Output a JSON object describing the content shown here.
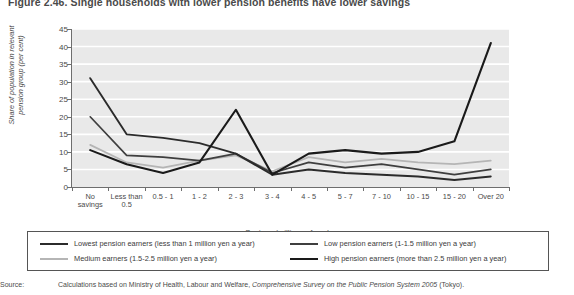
{
  "figure": {
    "title": "Figure 2.46. Single households with lower pension benefits have lower savings"
  },
  "source": {
    "label": "Source:",
    "prefix": "Calculations based on Ministry of Health, Labour and Welfare, ",
    "italic": "Comprehensive Survey on the Public Pension System 2005",
    "suffix": " (Tokyo)."
  },
  "axes": {
    "ylabel": "Share of population in relevant pension group (per cent)",
    "xlabel": "Savings (millions of yen)",
    "yticks": [
      "0",
      "5",
      "10",
      "15",
      "20",
      "25",
      "30",
      "35",
      "40",
      "45"
    ]
  },
  "legend": {
    "items": [
      {
        "label": "Lowest pension earners (less than 1 million yen a year)",
        "color": "#2b2b2b",
        "width": 1.9
      },
      {
        "label": "Low pension earners (1-1.5 million yen a year)",
        "color": "#3f3f3f",
        "width": 1.7
      },
      {
        "label": "Medium earners (1.5-2.5 million yen a year)",
        "color": "#b5b5b5",
        "width": 1.7
      },
      {
        "label": "High pension earners (more than 2.5 million yen a year)",
        "color": "#1a1a1a",
        "width": 2.1
      }
    ]
  },
  "chart_data": {
    "type": "line",
    "title": "Figure 2.46. Single households with lower pension benefits have lower savings",
    "xlabel": "Savings (millions of yen)",
    "ylabel": "Share of population in relevant pension group (per cent)",
    "categories": [
      "No savings",
      "Less than 0.5",
      "0.5 - 1",
      "1 - 2",
      "2 - 3",
      "3 - 4",
      "4 - 5",
      "5 - 7",
      "7 - 10",
      "10 - 15",
      "15 - 20",
      "Over 20"
    ],
    "ylim": [
      0,
      45
    ],
    "ytick_step": 5,
    "grid": "horizontal-white",
    "legend_position": "below",
    "series": [
      {
        "name": "Lowest pension earners (less than 1 million yen a year)",
        "color": "#2b2b2b",
        "values": [
          31,
          15,
          14,
          12.5,
          9.5,
          3.5,
          5,
          4,
          3.5,
          3,
          2,
          3
        ]
      },
      {
        "name": "Low pension earners (1-1.5 million yen a year)",
        "color": "#3f3f3f",
        "values": [
          20,
          9,
          8.5,
          7.5,
          9.5,
          4,
          7,
          5.5,
          6.5,
          5,
          3.5,
          5
        ]
      },
      {
        "name": "Medium earners (1.5-2.5 million yen a year)",
        "color": "#b5b5b5",
        "values": [
          12,
          7,
          5.5,
          7.5,
          9,
          4.5,
          8.5,
          7,
          8,
          7,
          6.5,
          7.5
        ]
      },
      {
        "name": "High pension earners (more than 2.5 million yen a year)",
        "color": "#1a1a1a",
        "values": [
          10.5,
          6.5,
          4,
          7,
          22,
          3.5,
          9.5,
          10.5,
          9.5,
          10,
          13,
          41
        ]
      }
    ]
  }
}
